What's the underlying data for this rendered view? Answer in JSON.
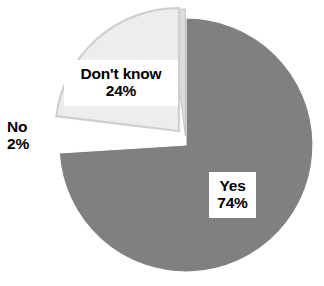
{
  "chart_data": {
    "type": "pie",
    "title": "",
    "subtitle": "",
    "xlabel": "",
    "ylabel": "",
    "legend_position": "none",
    "grid": false,
    "categories": [
      "Yes",
      "Don't know",
      "No"
    ],
    "values": [
      74,
      24,
      2
    ],
    "unit": "%",
    "slices": [
      {
        "name": "Yes",
        "label": "Yes",
        "value": 74,
        "value_label": "74%",
        "color": "#808080",
        "exploded": false,
        "start_angle_deg": 0,
        "end_angle_deg": 266.4,
        "label_style": "white-box-on-slice"
      },
      {
        "name": "Don't know",
        "label": "Don't know",
        "value": 24,
        "value_label": "24%",
        "color": "#ededed",
        "exploded": true,
        "start_angle_deg": 266.4,
        "end_angle_deg": 352.8,
        "label_style": "white-box-on-slice"
      },
      {
        "name": "No",
        "label": "No",
        "value": 2,
        "value_label": "2%",
        "color": "#dcdcdc",
        "exploded": true,
        "start_angle_deg": 352.8,
        "end_angle_deg": 360,
        "label_style": "plain-text-outside"
      }
    ]
  },
  "labels": {
    "yes": {
      "name": "Yes",
      "percent": "74%"
    },
    "dont_know": {
      "name": "Don't know",
      "percent": "24%"
    },
    "no": {
      "name": "No",
      "percent": "2%"
    }
  },
  "colors": {
    "background": "#ffffff",
    "yes_slice": "#808080",
    "dont_know_slice": "#ededed",
    "no_slice": "#dcdcdc",
    "slice_edge": "#ffffff",
    "dont_know_edge": "#c9c9c9",
    "text": "#000000"
  }
}
